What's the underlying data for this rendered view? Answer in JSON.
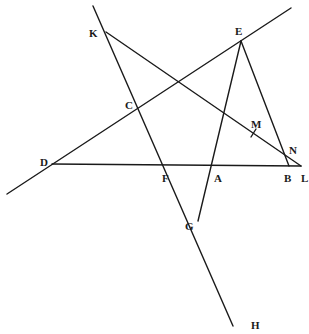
{
  "diagram": {
    "title": "",
    "points": {
      "K": {
        "label": "K",
        "x": 106,
        "y": 32
      },
      "E": {
        "label": "E",
        "x": 241,
        "y": 41
      },
      "C": {
        "label": "C",
        "x": 142,
        "y": 104
      },
      "M": {
        "label": "M",
        "x": 254,
        "y": 133
      },
      "N": {
        "label": "N",
        "x": 284,
        "y": 157
      },
      "D": {
        "label": "D",
        "x": 52,
        "y": 164
      },
      "F": {
        "label": "F",
        "x": 171,
        "y": 165
      },
      "A": {
        "label": "A",
        "x": 210,
        "y": 166
      },
      "B": {
        "label": "B",
        "x": 289,
        "y": 166
      },
      "L": {
        "label": "L",
        "x": 301,
        "y": 166
      },
      "G": {
        "label": "G",
        "x": 198,
        "y": 221
      },
      "H": {
        "label": "H",
        "x": 233,
        "y": 326
      }
    },
    "lines": [
      {
        "name": "line-KH",
        "from": "K",
        "to": "H",
        "through": [
          "C",
          "F",
          "G"
        ]
      },
      {
        "name": "line-DE",
        "from": "D",
        "to": "E",
        "through": [
          "C"
        ],
        "extended": true
      },
      {
        "name": "segment-DL",
        "from": "D",
        "to": "L",
        "through": [
          "F",
          "A",
          "B"
        ]
      },
      {
        "name": "segment-KL",
        "from": "K",
        "to": "L",
        "through": [
          "M",
          "N"
        ]
      },
      {
        "name": "segment-EG",
        "from": "E",
        "to": "G",
        "through": [
          "A"
        ]
      },
      {
        "name": "segment-EB",
        "from": "E",
        "to": "B",
        "through": [
          "N"
        ]
      }
    ],
    "tick_marks": [
      {
        "on": "segment-KL",
        "at": "M"
      }
    ]
  }
}
